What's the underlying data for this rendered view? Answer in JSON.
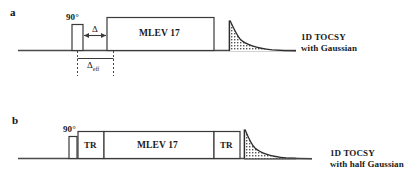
{
  "figure": {
    "type": "nmr-pulse-sequence-diagram",
    "background": "#ffffff",
    "line_color": "#3a3a3a",
    "text_color": "#1a1a1a",
    "width": 412,
    "height": 190
  },
  "panels": [
    {
      "id": "a",
      "label": "a",
      "pulse_label": "90°",
      "delay_label": "Δ",
      "effective_delay_label": "Δ",
      "effective_delay_subscript": "eff",
      "mixing_label": "MLEV 17",
      "acquisition": {
        "shape": "exponential-decay",
        "fill": "hatched"
      },
      "caption_line1": "1D TOCSY",
      "caption_line2": "with Gaussian"
    },
    {
      "id": "b",
      "label": "b",
      "pulse_label": "90°",
      "trim_label_left": "TR",
      "mixing_label": "MLEV 17",
      "trim_label_right": "TR",
      "acquisition": {
        "shape": "exponential-decay",
        "fill": "hatched"
      },
      "caption_line1": "1D TOCSY",
      "caption_line2": "with half Gaussian"
    }
  ]
}
